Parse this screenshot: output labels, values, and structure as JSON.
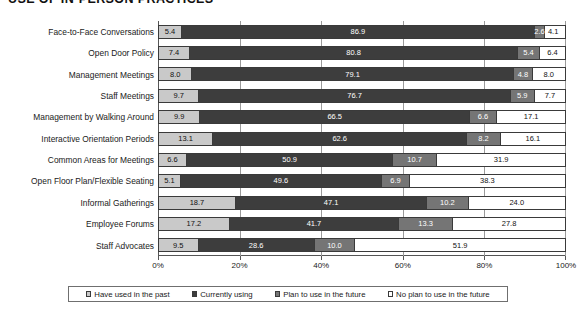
{
  "chart_data": {
    "type": "bar",
    "subtype": "horizontal-stacked-100",
    "title": "USE OF IN-PERSON PRACTICES",
    "xlabel": "",
    "ylabel": "",
    "xlim": [
      0,
      100
    ],
    "xticks": [
      "0%",
      "20%",
      "40%",
      "60%",
      "80%",
      "100%"
    ],
    "xtick_values": [
      0,
      20,
      40,
      60,
      80,
      100
    ],
    "grid": true,
    "legend_position": "bottom",
    "categories": [
      "Face-to-Face Conversations",
      "Open Door Policy",
      "Management Meetings",
      "Staff Meetings",
      "Management by Walking Around",
      "Interactive Orientation Periods",
      "Common Areas for Meetings",
      "Open Floor Plan/Flexible Seating",
      "Informal Gatherings",
      "Employee Forums",
      "Staff Advocates"
    ],
    "series": [
      {
        "name": "Have used in the past",
        "color": "#c9c9c9",
        "values": [
          5.4,
          7.4,
          8.0,
          9.7,
          9.9,
          13.1,
          6.6,
          5.1,
          18.7,
          17.2,
          9.5
        ]
      },
      {
        "name": "Currently using",
        "color": "#3d3d3d",
        "values": [
          86.9,
          80.8,
          79.1,
          76.7,
          66.5,
          62.6,
          50.9,
          49.6,
          47.1,
          41.7,
          28.6
        ]
      },
      {
        "name": "Plan to use in the future",
        "color": "#757575",
        "values": [
          2.6,
          5.4,
          4.8,
          5.9,
          6.6,
          8.2,
          10.7,
          6.9,
          10.2,
          13.3,
          10.0
        ]
      },
      {
        "name": "No plan to use in the future",
        "color": "#ffffff",
        "values": [
          4.1,
          6.4,
          8.0,
          7.7,
          17.1,
          16.1,
          31.9,
          38.3,
          24.0,
          27.8,
          51.9
        ]
      }
    ],
    "value_labels": [
      [
        "5.4",
        "86.9",
        "2.6",
        "4.1"
      ],
      [
        "7.4",
        "80.8",
        "5.4",
        "6.4"
      ],
      [
        "8.0",
        "79.1",
        "4.8",
        "8.0"
      ],
      [
        "9.7",
        "76.7",
        "5.9",
        "7.7"
      ],
      [
        "9.9",
        "66.5",
        "6.6",
        "17.1"
      ],
      [
        "13.1",
        "62.6",
        "8.2",
        "16.1"
      ],
      [
        "6.6",
        "50.9",
        "10.7",
        "31.9"
      ],
      [
        "5.1",
        "49.6",
        "6.9",
        "38.3"
      ],
      [
        "18.7",
        "47.1",
        "10.2",
        "24.0"
      ],
      [
        "17.2",
        "41.7",
        "13.3",
        "27.8"
      ],
      [
        "9.5",
        "28.6",
        "10.0",
        "51.9"
      ]
    ]
  }
}
